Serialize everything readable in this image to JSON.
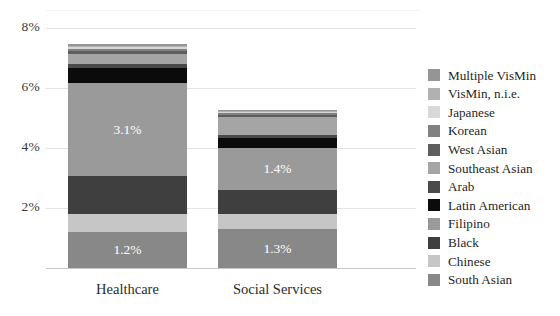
{
  "chart_data": {
    "type": "bar",
    "subtype": "stacked-bar",
    "title": "",
    "xlabel": "",
    "ylabel": "",
    "ylim": [
      0,
      8
    ],
    "yticks": [
      2,
      4,
      6,
      8
    ],
    "ytick_labels": [
      "2%",
      "4%",
      "6%",
      "8%"
    ],
    "grid": true,
    "grid_axis": "y",
    "legend_position": "right",
    "categories": [
      "Healthcare",
      "Social Services"
    ],
    "series": [
      {
        "name": "South Asian",
        "color": "#888888",
        "values": [
          1.2,
          1.3
        ]
      },
      {
        "name": "Chinese",
        "color": "#c6c6c6",
        "values": [
          0.6,
          0.5
        ]
      },
      {
        "name": "Black",
        "color": "#3f3f3f",
        "values": [
          1.25,
          0.8
        ]
      },
      {
        "name": "Filipino",
        "color": "#9a9a9a",
        "values": [
          3.1,
          1.4
        ]
      },
      {
        "name": "Latin American",
        "color": "#0b0b0b",
        "values": [
          0.5,
          0.33
        ]
      },
      {
        "name": "Arab",
        "color": "#4a4a4a",
        "values": [
          0.15,
          0.1
        ]
      },
      {
        "name": "Southeast Asian",
        "color": "#a5a5a5",
        "values": [
          0.33,
          0.6
        ]
      },
      {
        "name": "West Asian",
        "color": "#5e5e5e",
        "values": [
          0.1,
          0.08
        ]
      },
      {
        "name": "Korean",
        "color": "#818181",
        "values": [
          0.07,
          0.05
        ]
      },
      {
        "name": "Japanese",
        "color": "#d8d8d8",
        "values": [
          0.05,
          0.03
        ]
      },
      {
        "name": "VisMin, n.i.e.",
        "color": "#b1b1b1",
        "values": [
          0.05,
          0.03
        ]
      },
      {
        "name": "Multiple VisMin",
        "color": "#959595",
        "values": [
          0.07,
          0.05
        ]
      }
    ],
    "data_labels": [
      {
        "category": "Healthcare",
        "series": "Filipino",
        "text": "3.1%"
      },
      {
        "category": "Healthcare",
        "series": "South Asian",
        "text": "1.2%"
      },
      {
        "category": "Social Services",
        "series": "Filipino",
        "text": "1.4%"
      },
      {
        "category": "Social Services",
        "series": "South Asian",
        "text": "1.3%"
      }
    ]
  },
  "legend": {
    "entries": [
      {
        "label": "Multiple VisMin",
        "color": "#959595"
      },
      {
        "label": "VisMin, n.i.e.",
        "color": "#b1b1b1"
      },
      {
        "label": "Japanese",
        "color": "#d8d8d8"
      },
      {
        "label": "Korean",
        "color": "#818181"
      },
      {
        "label": "West Asian",
        "color": "#5e5e5e"
      },
      {
        "label": "Southeast Asian",
        "color": "#a5a5a5"
      },
      {
        "label": "Arab",
        "color": "#4a4a4a"
      },
      {
        "label": "Latin American",
        "color": "#0b0b0b"
      },
      {
        "label": "Filipino",
        "color": "#9a9a9a"
      },
      {
        "label": "Black",
        "color": "#3f3f3f"
      },
      {
        "label": "Chinese",
        "color": "#c6c6c6"
      },
      {
        "label": "South Asian",
        "color": "#888888"
      }
    ]
  },
  "axes": {
    "y_tick_labels": [
      "8%",
      "6%",
      "4%",
      "2%"
    ],
    "x_tick_labels": [
      "Healthcare",
      "Social Services"
    ]
  }
}
